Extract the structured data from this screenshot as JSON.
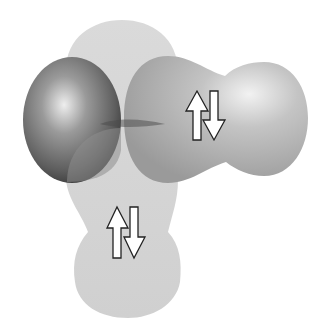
{
  "diagram": {
    "type": "molecular-orbital-illustration",
    "background": "#ffffff",
    "colors": {
      "vertical_lobe": "#d8d8d8",
      "sphere_dark": "#6a6a6a",
      "sphere_highlight": "#e6e6e6",
      "horizontal_lobe": "#a9a9a9",
      "horizontal_lobe_light": "#d4d4d4",
      "arrow_fill": "#ffffff",
      "arrow_stroke": "#222222"
    },
    "elements": [
      {
        "name": "central-atom-sphere",
        "shape": "sphere"
      },
      {
        "name": "vertical-lone-pair-lobe",
        "shape": "elongated-lobe",
        "electrons": "up-down pair"
      },
      {
        "name": "horizontal-bonding-lobe",
        "shape": "dumbbell-lobe",
        "electrons": "up-down pair"
      }
    ],
    "spin_pairs": [
      {
        "location": "horizontal-lobe",
        "arrows": [
          "up",
          "down"
        ]
      },
      {
        "location": "vertical-lobe",
        "arrows": [
          "up",
          "down"
        ]
      }
    ]
  }
}
